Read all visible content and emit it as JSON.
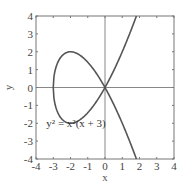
{
  "chart_data": {
    "type": "line",
    "title": "",
    "xlabel": "x",
    "ylabel": "y",
    "xlim": [
      -4,
      4
    ],
    "ylim": [
      -4,
      4
    ],
    "grid": false,
    "x_ticks": [
      -4,
      -3,
      -2,
      -1,
      0,
      1,
      2,
      3,
      4
    ],
    "y_ticks": [
      -4,
      -3,
      -2,
      -1,
      0,
      1,
      2,
      3,
      4
    ],
    "x_tick_labels": [
      "-4",
      "-3",
      "-2",
      "-1",
      "0",
      "1",
      "2",
      "3",
      "4"
    ],
    "y_tick_labels": [
      "-4",
      "-3",
      "-2",
      "-1",
      "0",
      "1",
      "2",
      "3",
      "4"
    ],
    "reference_lines": [
      {
        "orientation": "horizontal",
        "value": 0
      },
      {
        "orientation": "vertical",
        "value": 0
      }
    ],
    "series": [
      {
        "name": "y^2 = x^2(x + 3)",
        "equation": "y^2 = x^2(x + 3)",
        "color": "#555555",
        "description": "nodal cubic with a loop for x in [-3, 0] and two branches for x > 0",
        "points": [
          [
            -3,
            0
          ],
          [
            -2.5,
            0.79
          ],
          [
            -2,
            2
          ],
          [
            -1.5,
            1.84
          ],
          [
            -1,
            1.41
          ],
          [
            -0.5,
            0.79
          ],
          [
            0,
            0
          ],
          [
            0.5,
            0.94
          ],
          [
            1,
            2
          ],
          [
            1.5,
            3.18
          ],
          [
            1.8,
            3.94
          ],
          [
            -2.5,
            -0.79
          ],
          [
            -2,
            -2
          ],
          [
            -1.5,
            -1.84
          ],
          [
            -1,
            -1.41
          ],
          [
            -0.5,
            -0.79
          ],
          [
            0.5,
            -0.94
          ],
          [
            1,
            -2
          ],
          [
            1.5,
            -3.18
          ],
          [
            1.8,
            -3.94
          ]
        ]
      }
    ],
    "annotations": [
      {
        "text": "y² = x²(x + 3)",
        "x": -3.4,
        "y": -2.0
      }
    ],
    "colors": {
      "curve": "#555555",
      "frame": "#777777",
      "reference": "#888888"
    }
  }
}
